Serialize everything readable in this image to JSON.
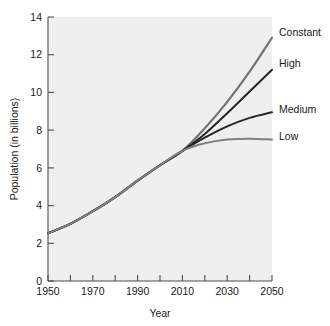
{
  "chart_data": {
    "type": "line",
    "title": "",
    "xlabel": "Year",
    "ylabel": "Population (in billions)",
    "xlim": [
      1950,
      2050
    ],
    "ylim": [
      0,
      14
    ],
    "xticks": [
      1950,
      1960,
      1970,
      1980,
      1990,
      2000,
      2010,
      2020,
      2030,
      2040,
      2050
    ],
    "xtick_labels": [
      "1950",
      "",
      "1970",
      "",
      "1990",
      "",
      "2010",
      "",
      "2030",
      "",
      "2050"
    ],
    "yticks": [
      0,
      2,
      4,
      6,
      8,
      10,
      12,
      14
    ],
    "ytick_labels": [
      "0",
      "2",
      "4",
      "6",
      "8",
      "10",
      "12",
      "14"
    ],
    "grid": false,
    "legend_position": "right-inline-labels",
    "x": [
      1950,
      1960,
      1970,
      1980,
      1990,
      2000,
      2010,
      2020,
      2030,
      2040,
      2050
    ],
    "series": [
      {
        "name": "Constant",
        "color": "#737373",
        "values": [
          2.53,
          3.03,
          3.7,
          4.45,
          5.32,
          6.14,
          6.9,
          8.1,
          9.5,
          11.1,
          12.9
        ]
      },
      {
        "name": "High",
        "color": "#262626",
        "values": [
          2.53,
          3.03,
          3.7,
          4.45,
          5.32,
          6.14,
          6.9,
          7.8,
          8.9,
          10.05,
          11.2
        ]
      },
      {
        "name": "Medium",
        "color": "#262626",
        "values": [
          2.53,
          3.03,
          3.7,
          4.45,
          5.32,
          6.14,
          6.9,
          7.6,
          8.2,
          8.65,
          8.95
        ]
      },
      {
        "name": "Low",
        "color": "#808080",
        "values": [
          2.53,
          3.03,
          3.7,
          4.45,
          5.32,
          6.14,
          6.9,
          7.3,
          7.5,
          7.55,
          7.5
        ]
      }
    ]
  },
  "labels": {
    "constant": "Constant",
    "high": "High",
    "medium": "Medium",
    "low": "Low"
  },
  "axes": {
    "x_title": "Year",
    "y_title": "Population (in billions)"
  },
  "ytick_text": {
    "t0": "0",
    "t2": "2",
    "t4": "4",
    "t6": "6",
    "t8": "8",
    "t10": "10",
    "t12": "12",
    "t14": "14"
  },
  "xtick_text": {
    "t1950": "1950",
    "t1970": "1970",
    "t1990": "1990",
    "t2010": "2010",
    "t2030": "2030",
    "t2050": "2050"
  },
  "colors": {
    "plot_background": "#efefef",
    "axis": "#4d4d4d",
    "text": "#1a1a1a",
    "constant": "#737373",
    "high": "#262626",
    "medium": "#262626",
    "low": "#808080"
  }
}
